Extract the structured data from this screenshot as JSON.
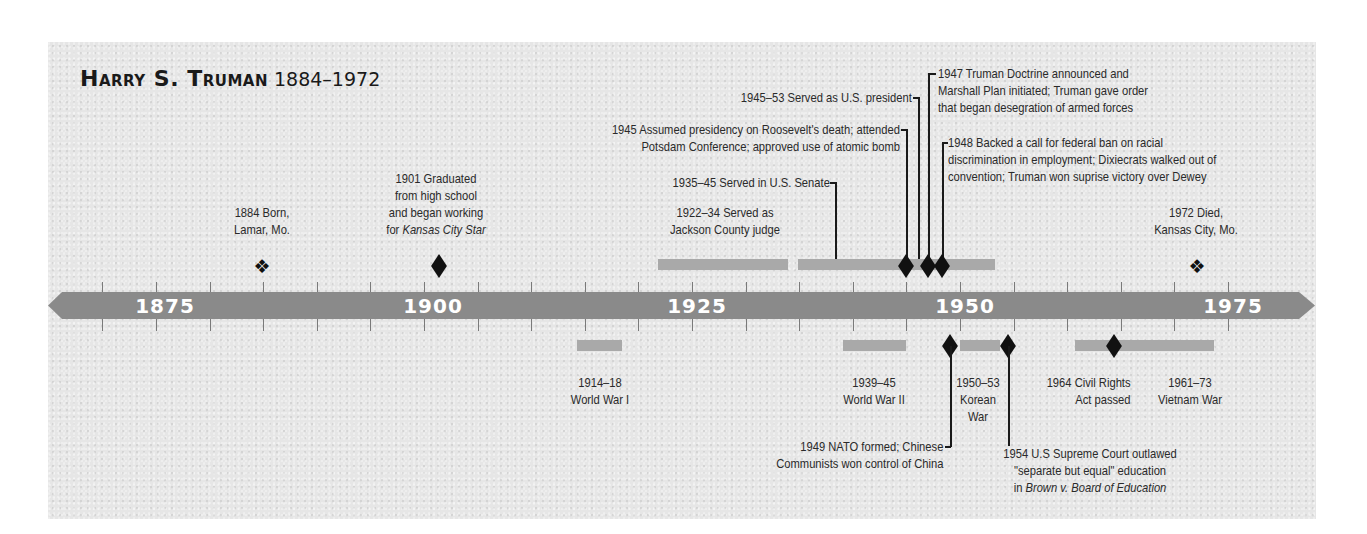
{
  "title": {
    "name": "Harry S. Truman",
    "dates": "1884–1972"
  },
  "axis": {
    "labels": [
      {
        "year": "1875",
        "x": 165
      },
      {
        "year": "1900",
        "x": 433
      },
      {
        "year": "1925",
        "x": 697
      },
      {
        "year": "1950",
        "x": 965
      },
      {
        "year": "1975",
        "x": 1233
      }
    ],
    "band_color": "#8a8a8a",
    "event_bar_color": "#a9a9a9",
    "scale": {
      "year0": 1950,
      "x0": 960,
      "px_per_year": 10.72
    }
  },
  "events_above": [
    {
      "id": "born",
      "label_line1": "1884 Born,",
      "label_line2": "Lamar, Mo.",
      "year": 1884,
      "marker": "cluster"
    },
    {
      "id": "graduated",
      "label_line1": "1901 Graduated",
      "label_line2": "from high school",
      "label_line3": "and began working",
      "label_line4_prefix": "for ",
      "label_line4_italic": "Kansas City Star",
      "year": 1901,
      "marker": "diamond"
    },
    {
      "id": "judge",
      "label_line1": "1922–34 Served as",
      "label_line2": "Jackson County judge",
      "start": 1922,
      "end": 1934,
      "marker": "bar"
    },
    {
      "id": "senate",
      "label": "1935–45 Served in U.S. Senate",
      "start": 1935,
      "end": 1945,
      "marker": "bar"
    },
    {
      "id": "president",
      "label": "1945–53 Served as U.S. president",
      "start": 1945,
      "end": 1953,
      "marker": "bar"
    },
    {
      "id": "assumed",
      "label_line1": "1945 Assumed presidency on Roosevelt's death; attended",
      "label_line2": "Potsdam Conference; approved use of atomic bomb",
      "year": 1945,
      "marker": "diamond"
    },
    {
      "id": "doctrine",
      "label_line1": "1947 Truman Doctrine announced and",
      "label_line2": "Marshall Plan initiated; Truman gave order",
      "label_line3": "that began desegration of armed forces",
      "year": 1947,
      "marker": "diamond"
    },
    {
      "id": "civil-rights-1948",
      "label_line1": "1948 Backed a call for federal ban on racial",
      "label_line2": "discrimination in employment; Dixiecrats walked out of",
      "label_line3": "convention; Truman won suprise victory over Dewey",
      "year": 1948,
      "marker": "diamond"
    },
    {
      "id": "died",
      "label_line1": "1972 Died,",
      "label_line2": "Kansas City, Mo.",
      "year": 1972,
      "marker": "cluster"
    }
  ],
  "events_below": [
    {
      "id": "ww1",
      "label_line1": "1914–18",
      "label_line2": "World War I",
      "start": 1914,
      "end": 1918,
      "marker": "bar"
    },
    {
      "id": "ww2",
      "label_line1": "1939–45",
      "label_line2": "World War II",
      "start": 1939,
      "end": 1945,
      "marker": "bar"
    },
    {
      "id": "korea",
      "label_line1": "1950–53",
      "label_line2": "Korean",
      "label_line3": "War",
      "start": 1950,
      "end": 1953,
      "marker": "bar"
    },
    {
      "id": "nato",
      "label_line1": "1949 NATO formed; Chinese",
      "label_line2": "Communists won control of China",
      "year": 1949,
      "marker": "diamond"
    },
    {
      "id": "brown",
      "label_line1": "1954 U.S Supreme Court outlawed",
      "label_line2": "\"separate but equal\" education",
      "label_line3_prefix": "in ",
      "label_line3_italic": "Brown v. Board of Education",
      "year": 1954,
      "marker": "diamond"
    },
    {
      "id": "civil-rights-act",
      "label_line1": "1964 Civil Rights",
      "label_line2": "Act passed",
      "year": 1964,
      "marker": "diamond"
    },
    {
      "id": "vietnam",
      "label_line1": "1961–73",
      "label_line2": "Vietnam War",
      "start": 1961,
      "end": 1973,
      "marker": "bar"
    }
  ],
  "chart_data": {
    "type": "timeline",
    "axis_range": [
      1870,
      1980
    ],
    "axis_ticks_every": 5,
    "axis_labels": [
      1875,
      1900,
      1925,
      1950,
      1975
    ],
    "truman_events": [
      {
        "start": 1884,
        "label": "Born, Lamar, Mo."
      },
      {
        "start": 1901,
        "label": "Graduated from high school and began working for Kansas City Star"
      },
      {
        "start": 1922,
        "end": 1934,
        "label": "Served as Jackson County judge"
      },
      {
        "start": 1935,
        "end": 1945,
        "label": "Served in U.S. Senate"
      },
      {
        "start": 1945,
        "end": 1953,
        "label": "Served as U.S. president"
      },
      {
        "start": 1945,
        "label": "Assumed presidency on Roosevelt's death; attended Potsdam Conference; approved use of atomic bomb"
      },
      {
        "start": 1947,
        "label": "Truman Doctrine announced and Marshall Plan initiated; Truman gave order that began desegration of armed forces"
      },
      {
        "start": 1948,
        "label": "Backed a call for federal ban on racial discrimination in employment; Dixiecrats walked out of convention; Truman won suprise victory over Dewey"
      },
      {
        "start": 1972,
        "label": "Died, Kansas City, Mo."
      }
    ],
    "world_events": [
      {
        "start": 1914,
        "end": 1918,
        "label": "World War I"
      },
      {
        "start": 1939,
        "end": 1945,
        "label": "World War II"
      },
      {
        "start": 1949,
        "label": "NATO formed; Chinese Communists won control of China"
      },
      {
        "start": 1950,
        "end": 1953,
        "label": "Korean War"
      },
      {
        "start": 1954,
        "label": "U.S Supreme Court outlawed \"separate but equal\" education in Brown v. Board of Education"
      },
      {
        "start": 1961,
        "end": 1973,
        "label": "Vietnam War"
      },
      {
        "start": 1964,
        "label": "Civil Rights Act passed"
      }
    ]
  }
}
